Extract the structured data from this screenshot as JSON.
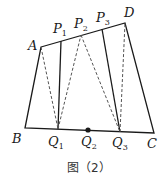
{
  "figure": {
    "caption": "图（2）",
    "points": {
      "A": {
        "label": "A",
        "sub": ""
      },
      "B": {
        "label": "B",
        "sub": ""
      },
      "C": {
        "label": "C",
        "sub": ""
      },
      "D": {
        "label": "D",
        "sub": ""
      },
      "P1": {
        "label": "P",
        "sub": "1"
      },
      "P2": {
        "label": "P",
        "sub": "2"
      },
      "P3": {
        "label": "P",
        "sub": "3"
      },
      "Q1": {
        "label": "Q",
        "sub": "1"
      },
      "Q2": {
        "label": "Q",
        "sub": "2"
      },
      "Q3": {
        "label": "Q",
        "sub": "3"
      }
    },
    "colors": {
      "line": "#1a1a1a",
      "dashed": "#555555"
    }
  }
}
